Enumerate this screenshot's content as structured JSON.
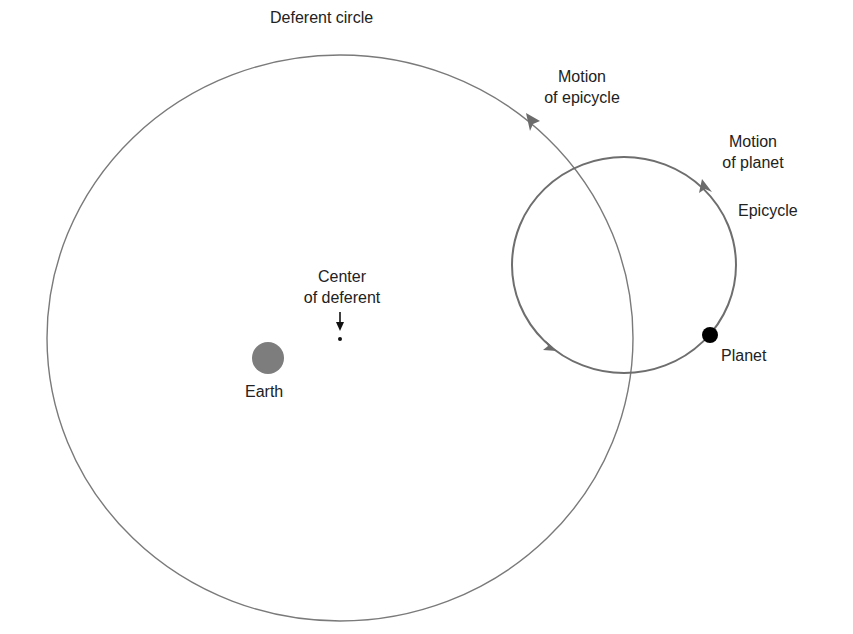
{
  "diagram": {
    "labels": {
      "deferent_circle": "Deferent circle",
      "motion_epicycle_line1": "Motion",
      "motion_epicycle_line2": "of epicycle",
      "motion_planet_line1": "Motion",
      "motion_planet_line2": "of planet",
      "epicycle": "Epicycle",
      "center_line1": "Center",
      "center_line2": "of deferent",
      "earth": "Earth",
      "planet": "Planet"
    },
    "colors": {
      "deferent_stroke": "#7a7a7a",
      "epicycle_stroke": "#6e6e6e",
      "arrow": "#6b6b6b",
      "earth": "#7d7d7d",
      "planet": "#000000",
      "text": "#222222"
    },
    "geometry": {
      "deferent": {
        "cx": 340,
        "cy": 338,
        "rx": 293,
        "ry": 283
      },
      "epicycle": {
        "cx": 624,
        "cy": 265,
        "rx": 112,
        "ry": 108
      },
      "earth": {
        "cx": 268,
        "cy": 358,
        "r": 16
      },
      "center_point": {
        "cx": 340,
        "cy": 340
      },
      "planet": {
        "cx": 710,
        "cy": 335,
        "r": 8
      }
    }
  }
}
